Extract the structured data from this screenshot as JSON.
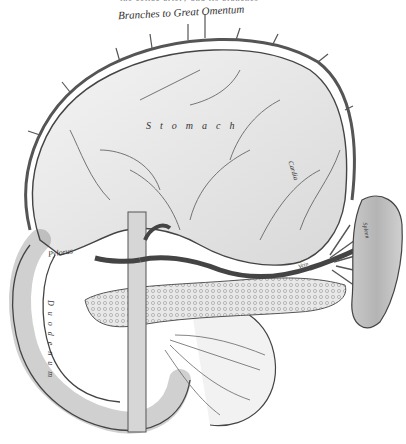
{
  "figure": {
    "type": "anatomical engraving",
    "colors": {
      "ink": "#333333",
      "shade": "#9a9a9a",
      "paper": "#ffffff"
    }
  },
  "labels": {
    "cut_caption": "the celiac artery and its branches",
    "title": "Branches to Great Omentum",
    "stomach": "Stomach",
    "cardia": "Cardia",
    "pylorus": "Pylorus",
    "duodenum": "Duodenum",
    "vein": "Vein",
    "spleen": "Spleen"
  }
}
